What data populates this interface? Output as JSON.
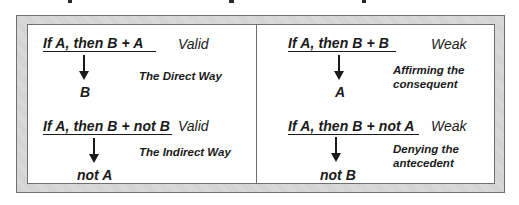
{
  "diagram": {
    "quadrants": [
      {
        "id": "direct-way",
        "premise": "If A, then B + A ",
        "verdict": "Valid",
        "conclusion": "B",
        "label_lines": [
          "The Direct Way"
        ]
      },
      {
        "id": "affirming-consequent",
        "premise": "If A, then B + B",
        "verdict": "Weak",
        "conclusion": "A",
        "label_lines": [
          "Affirming the",
          "consequent"
        ]
      },
      {
        "id": "indirect-way",
        "premise": "If A, then B + not B",
        "verdict": "Valid",
        "conclusion": "not A",
        "label_lines": [
          "The Indirect Way"
        ]
      },
      {
        "id": "denying-antecedent",
        "premise": "If A, then B + not A ",
        "verdict": "Weak",
        "conclusion": "not B",
        "label_lines": [
          "Denying the",
          "antecedent"
        ]
      }
    ],
    "colors": {
      "text": "#1a1a1a",
      "frame": "#d4d4d4",
      "border": "#6f6f6f",
      "panel": "#ffffff"
    }
  }
}
